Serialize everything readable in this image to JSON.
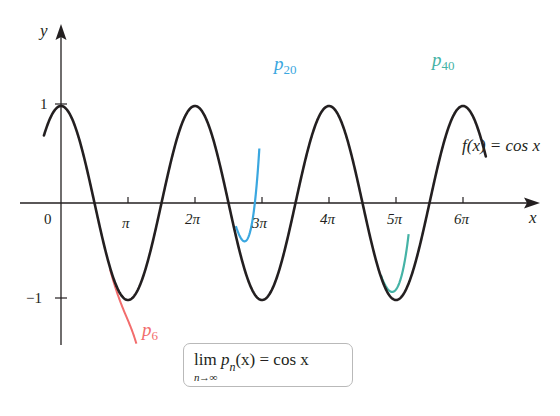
{
  "chart_data": {
    "type": "line",
    "title": "",
    "xlabel": "x",
    "ylabel": "y",
    "x_ticks": [
      "0",
      "π",
      "2π",
      "3π",
      "4π",
      "5π",
      "6π"
    ],
    "x_tick_values": [
      0,
      3.14159,
      6.28319,
      9.42478,
      12.56637,
      15.70796,
      18.84956
    ],
    "y_ticks": [
      "1",
      "−1"
    ],
    "y_tick_values": [
      1,
      -1
    ],
    "xlim": [
      -0.8,
      20.0
    ],
    "ylim": [
      -1.6,
      1.6
    ],
    "grid": false,
    "series": [
      {
        "name": "f(x) = cos x",
        "color": "#231f20",
        "x_range": [
          -0.8,
          19.92
        ],
        "function": "cos(x)"
      },
      {
        "name": "p6",
        "color": "#f26d6d",
        "x_range": [
          2.3,
          3.6
        ],
        "function": "Taylor polynomial of degree 6 for cos x",
        "notes": "follows cos x near x≈2.3 then diverges downward to y≈-1.45 at x≈3.6"
      },
      {
        "name": "p20",
        "color": "#3aa7e0",
        "x_range": [
          8.2,
          9.3
        ],
        "function": "Taylor polynomial of degree 20 for cos x",
        "notes": "follows cos x until ~8.2, min ≈ -0.27 at x≈8.8, rises steeply above y=1.6 near x≈9.2"
      },
      {
        "name": "p40",
        "color": "#45b3a6",
        "x_range": [
          15.0,
          16.3
        ],
        "function": "Taylor polynomial of degree 40 for cos x",
        "notes": "follows cos x until ~15.0, min ≈ -0.9 at x≈15.5, rises steeply above y=1.6 near x≈16.3"
      }
    ],
    "annotations": [
      {
        "text": "f(x) = cos x",
        "position": "right, near x≈19.5, y≈0.35"
      },
      {
        "text": "p_6",
        "position": "below -1 near x≈π"
      },
      {
        "text": "p_20",
        "position": "top near x≈3π"
      },
      {
        "text": "p_40",
        "position": "top near x≈5π"
      },
      {
        "text": "lim_{n→∞} p_n(x) = cos x",
        "position": "boxed, bottom center"
      }
    ]
  },
  "labels": {
    "y_axis": "y",
    "x_axis": "x",
    "origin": "0",
    "y_one": "1",
    "y_neg_one": "−1",
    "x_pi": "π",
    "x_2pi": "2π",
    "x_3pi": "3π",
    "x_4pi": "4π",
    "x_5pi": "5π",
    "x_6pi": "6π",
    "p6_base": "p",
    "p6_sub": "6",
    "p20_base": "p",
    "p20_sub": "20",
    "p40_base": "p",
    "p40_sub": "40",
    "f_label": "f(x) = cos x",
    "formula_lim": "lim",
    "formula_under": "n→∞",
    "formula_p": "p",
    "formula_sub": "n",
    "formula_rest": "(x) = cos x"
  },
  "colors": {
    "axis": "#231f20",
    "cos": "#231f20",
    "p6": "#f26d6d",
    "p20": "#3aa7e0",
    "p40": "#45b3a6"
  }
}
